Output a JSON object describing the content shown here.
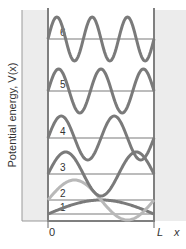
{
  "diagram": {
    "ylabel": "Potential energy, V(x)",
    "xlabel": "x",
    "x_start_label": "0",
    "x_end_label": "L",
    "colors": {
      "wall": "#ececec",
      "line": "#808080",
      "wave": "#7a7a7a",
      "wave_n2": "#b8b8b8",
      "level": "#7a7a7a"
    },
    "levels": [
      {
        "n": "1",
        "y": 214
      },
      {
        "n": "2",
        "y": 200
      },
      {
        "n": "3",
        "y": 174
      },
      {
        "n": "4",
        "y": 138
      },
      {
        "n": "5",
        "y": 91
      },
      {
        "n": "6",
        "y": 39
      }
    ]
  }
}
